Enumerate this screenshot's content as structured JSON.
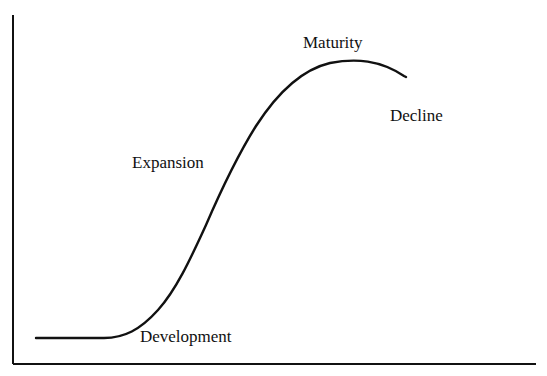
{
  "diagram": {
    "type": "life-cycle-curve",
    "stroke_color": "#111111",
    "background_color": "#ffffff",
    "stages": [
      {
        "id": "development",
        "label": "Development"
      },
      {
        "id": "expansion",
        "label": "Expansion"
      },
      {
        "id": "maturity",
        "label": "Maturity"
      },
      {
        "id": "decline",
        "label": "Decline"
      }
    ],
    "axes": {
      "x_label": "",
      "y_label": "",
      "ticks": false
    }
  }
}
